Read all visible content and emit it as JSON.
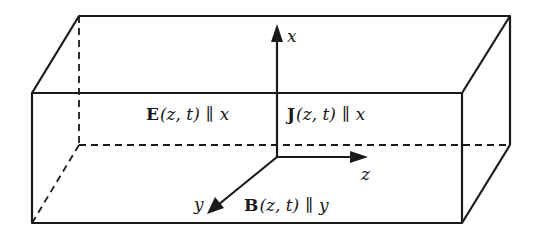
{
  "diagram": {
    "type": "3d-box-with-axes",
    "axes": {
      "x": "x",
      "y": "y",
      "z": "z"
    },
    "labels": {
      "E_symbol": "E",
      "E_args": "(z, t)",
      "E_par": "∥",
      "E_dir": "x",
      "J_symbol": "J",
      "J_args": "(z, t)",
      "J_par": "∥",
      "J_dir": "x",
      "B_symbol": "B",
      "B_args": "(z, t)",
      "B_par": "∥",
      "B_dir": "y"
    },
    "colors": {
      "line": "#1a1a1a",
      "background": "#ffffff"
    }
  }
}
